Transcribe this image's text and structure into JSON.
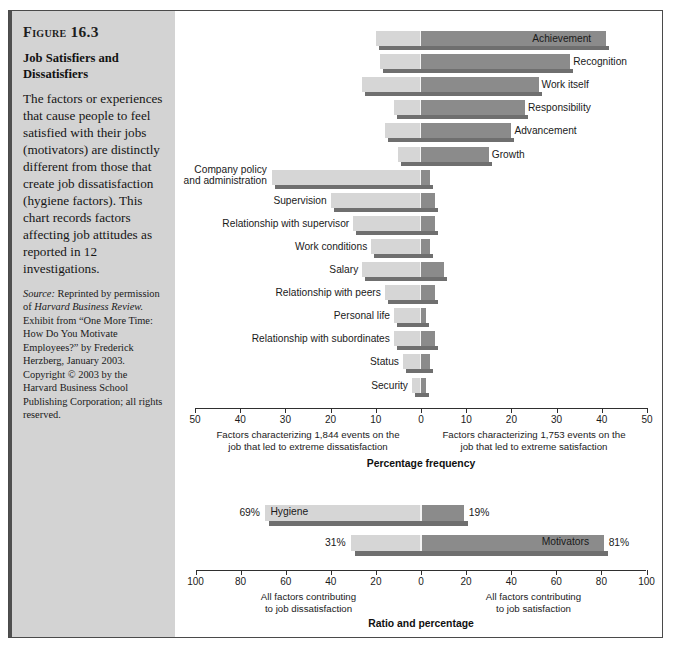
{
  "figure": {
    "label": "Figure",
    "number": "16.3",
    "title": "Job Satisfiers and Dissatisfiers",
    "body": "The factors or experiences that cause people to feel satisfied with their jobs (motivators) are distinctly different from those that create job dissatisfaction (hygiene factors). This chart records factors affecting job attitudes as reported in 12 investigations.",
    "source_prefix": "Source:",
    "source_text": " Reprinted by permission of ",
    "source_italic": "Harvard Business Review.",
    "source_rest": " Exhibit from “One More Time: How Do You Motivate Employees?” by Frederick Herzberg, January 2003. Copyright © 2003 by the Harvard Business School Publishing Corporation; all rights reserved."
  },
  "colors": {
    "light_bar": "#d6d6d6",
    "dark_bar": "#8b8b8b",
    "shadow": "#6f6f6f",
    "panel_bg": "#d3d3d3",
    "frame": "#4a4a4a",
    "axis": "#2f2f2f"
  },
  "chart_data": [
    {
      "type": "bar",
      "orientation": "horizontal-diverging",
      "title": "",
      "xlabel": "Percentage frequency",
      "ylabel": "",
      "xlim": [
        -50,
        50
      ],
      "xticks": [
        50,
        40,
        30,
        20,
        10,
        0,
        10,
        20,
        30,
        40,
        50
      ],
      "grid": false,
      "legend": "none",
      "left_caption": "Factors characterizing 1,844 events on the job that led to extreme dissatisfaction",
      "right_caption": "Factors characterizing 1,753 events on the job that led to extreme satisfaction",
      "series": [
        {
          "name": "Dissatisfaction (left, light)",
          "color": "#d6d6d6"
        },
        {
          "name": "Satisfaction (right, dark)",
          "color": "#8b8b8b"
        }
      ],
      "categories": [
        "Achievement",
        "Recognition",
        "Work itself",
        "Responsibility",
        "Advancement",
        "Growth",
        "Company policy and administration",
        "Supervision",
        "Relationship with supervisor",
        "Work conditions",
        "Salary",
        "Relationship with peers",
        "Personal life",
        "Relationship with subordinates",
        "Status",
        "Security"
      ],
      "left_values": [
        10,
        9,
        13,
        6,
        8,
        5,
        33,
        20,
        15,
        11,
        13,
        8,
        6,
        6,
        4,
        2
      ],
      "right_values": [
        41,
        33,
        26,
        23,
        20,
        15,
        2,
        3,
        3,
        2,
        5,
        3,
        1,
        3,
        2,
        1
      ],
      "label_side": [
        "right",
        "right",
        "right",
        "right",
        "right",
        "right",
        "left",
        "left",
        "left",
        "left",
        "left",
        "left",
        "left",
        "left",
        "left",
        "left"
      ]
    },
    {
      "type": "bar",
      "orientation": "horizontal-diverging",
      "title": "",
      "xlabel": "Ratio and percentage",
      "ylabel": "",
      "xlim": [
        -100,
        100
      ],
      "xticks": [
        100,
        80,
        60,
        40,
        20,
        0,
        20,
        40,
        60,
        80,
        100
      ],
      "grid": false,
      "left_caption": "All factors contributing to job dissatisfaction",
      "right_caption": "All factors contributing to job satisfaction",
      "categories": [
        "Hygiene",
        "Motivators"
      ],
      "left_values": [
        69,
        31
      ],
      "right_values": [
        19,
        81
      ],
      "left_labels": [
        "69%",
        "31%"
      ],
      "right_labels": [
        "19%",
        "81%"
      ],
      "bar_name_side": [
        "left-inside",
        "right-inside"
      ]
    }
  ],
  "axis1": {
    "ticks": [
      {
        "label": "50",
        "value": -50
      },
      {
        "label": "40",
        "value": -40
      },
      {
        "label": "30",
        "value": -30
      },
      {
        "label": "20",
        "value": -20
      },
      {
        "label": "10",
        "value": -10
      },
      {
        "label": "0",
        "value": 0
      },
      {
        "label": "10",
        "value": 10
      },
      {
        "label": "20",
        "value": 20
      },
      {
        "label": "30",
        "value": 30
      },
      {
        "label": "40",
        "value": 40
      },
      {
        "label": "50",
        "value": 50
      }
    ],
    "left_caption_line1": "Factors characterizing 1,844 events on the",
    "left_caption_line2": "job that led to extreme dissatisfaction",
    "right_caption_line1": "Factors characterizing 1,753 events on the",
    "right_caption_line2": "job that led to extreme satisfaction",
    "title": "Percentage frequency"
  },
  "axis2": {
    "ticks": [
      {
        "label": "100",
        "value": -100
      },
      {
        "label": "80",
        "value": -80
      },
      {
        "label": "60",
        "value": -60
      },
      {
        "label": "40",
        "value": -40
      },
      {
        "label": "20",
        "value": -20
      },
      {
        "label": "0",
        "value": 0
      },
      {
        "label": "20",
        "value": 20
      },
      {
        "label": "40",
        "value": 40
      },
      {
        "label": "60",
        "value": 60
      },
      {
        "label": "80",
        "value": 80
      },
      {
        "label": "100",
        "value": 100
      }
    ],
    "left_caption_line1": "All factors contributing",
    "left_caption_line2": "to job dissatisfaction",
    "right_caption_line1": "All factors contributing",
    "right_caption_line2": "to job satisfaction",
    "title": "Ratio and percentage"
  },
  "bars1": [
    {
      "name": "Achievement",
      "left": 10,
      "right": 41,
      "side": "right"
    },
    {
      "name": "Recognition",
      "left": 9,
      "right": 33,
      "side": "right"
    },
    {
      "name": "Work itself",
      "left": 13,
      "right": 26,
      "side": "right"
    },
    {
      "name": "Responsibility",
      "left": 6,
      "right": 23,
      "side": "right"
    },
    {
      "name": "Advancement",
      "left": 8,
      "right": 20,
      "side": "right"
    },
    {
      "name": "Growth",
      "left": 5,
      "right": 15,
      "side": "right"
    },
    {
      "name": "Company policy and administration",
      "left": 33,
      "right": 2,
      "side": "left"
    },
    {
      "name": "Supervision",
      "left": 20,
      "right": 3,
      "side": "left"
    },
    {
      "name": "Relationship with supervisor",
      "left": 15,
      "right": 3,
      "side": "left"
    },
    {
      "name": "Work conditions",
      "left": 11,
      "right": 2,
      "side": "left"
    },
    {
      "name": "Salary",
      "left": 13,
      "right": 5,
      "side": "left"
    },
    {
      "name": "Relationship with peers",
      "left": 8,
      "right": 3,
      "side": "left"
    },
    {
      "name": "Personal life",
      "left": 6,
      "right": 1,
      "side": "left"
    },
    {
      "name": "Relationship with subordinates",
      "left": 6,
      "right": 3,
      "side": "left"
    },
    {
      "name": "Status",
      "left": 4,
      "right": 2,
      "side": "left"
    },
    {
      "name": "Security",
      "left": 2,
      "right": 1,
      "side": "left"
    }
  ],
  "bars2": [
    {
      "name": "Hygiene",
      "left": 69,
      "right": 19,
      "left_label": "69%",
      "right_label": "19%",
      "name_side": "left"
    },
    {
      "name": "Motivators",
      "left": 31,
      "right": 81,
      "left_label": "31%",
      "right_label": "81%",
      "name_side": "right"
    }
  ]
}
